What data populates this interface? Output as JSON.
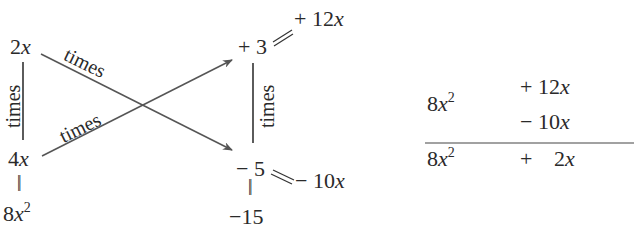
{
  "cross_diagram": {
    "left_top": {
      "coef": "2",
      "var": "x"
    },
    "left_bottom": {
      "coef": "4",
      "var": "x"
    },
    "left_product": {
      "coef": "8",
      "var": "x",
      "exp": "2"
    },
    "left_eq": "||",
    "right_top": "+ 3",
    "right_bottom": "− 5",
    "right_product": "−15",
    "right_eq": "||",
    "cross_top_result": {
      "prefix": "+ 12",
      "var": "x"
    },
    "cross_bottom_result": {
      "prefix": "− 10",
      "var": "x"
    },
    "labels": {
      "left_vertical": "times",
      "right_vertical": "times",
      "diag_down": "times",
      "diag_up": "times"
    },
    "line_color": "#555555"
  },
  "sum_table": {
    "row1_left": {
      "coef": "8",
      "var": "x",
      "exp": "2"
    },
    "row1_right": {
      "prefix": "+ 12",
      "var": "x"
    },
    "row2_right": {
      "prefix": "− 10",
      "var": "x"
    },
    "result_left": {
      "coef": "8",
      "var": "x",
      "exp": "2"
    },
    "result_op": "+",
    "result_right": {
      "prefix": "2",
      "var": "x"
    }
  }
}
